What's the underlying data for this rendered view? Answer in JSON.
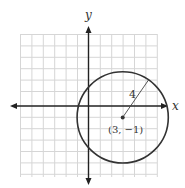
{
  "figure": {
    "axis_labels": {
      "x": "x",
      "y": "y"
    },
    "center_label": "(3, −1)",
    "radius_label": "4",
    "circle": {
      "center": [
        3,
        -1
      ],
      "radius": 4
    },
    "grid": {
      "x_range": [
        -6,
        6
      ],
      "y_range": [
        -6,
        6
      ],
      "unit": 1
    },
    "colors": {
      "grid": "#d9d9d9",
      "axis": "#222222",
      "circle": "#333333"
    }
  }
}
